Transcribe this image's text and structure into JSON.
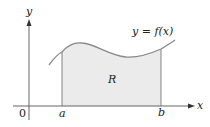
{
  "figure": {
    "axis_labels": {
      "x": "x",
      "y": "y",
      "origin": "0"
    },
    "ticks": {
      "a": "a",
      "b": "b"
    },
    "region_label": "R",
    "curve_label": "y = f(x)",
    "colors": {
      "region_fill": "#ebebeb",
      "curve": "#8a8a8a",
      "axes": "#555555",
      "boundary": "#777777",
      "text": "#222222"
    }
  }
}
